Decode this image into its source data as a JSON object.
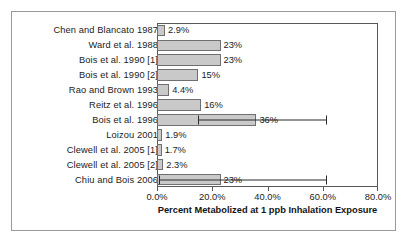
{
  "chart_data": {
    "type": "bar",
    "orientation": "horizontal",
    "title": "",
    "xlabel": "Percent Metabolized at 1 ppb Inhalation Exposure",
    "ylabel": "",
    "xlim": [
      0,
      80
    ],
    "xtick_labels": [
      "0.0%",
      "20.0%",
      "40.0%",
      "60.0%",
      "80.0%"
    ],
    "xticks": [
      0,
      20,
      40,
      60,
      80
    ],
    "grid": false,
    "legend": null,
    "bar_color": "#c9c9c9",
    "bar_edge_color": "#6f6f71",
    "categories": [
      "Chen and Blancato 1987",
      "Ward et al. 1988",
      "Bois et al. 1990 [1]",
      "Bois et al. 1990 [2]",
      "Rao and Brown 1993",
      "Reitz et al. 1996",
      "Bois et al. 1996",
      "Loizou 2001",
      "Clewell et al. 2005 [1]",
      "Clewell et al. 2005 [2]",
      "Chiu and Bois 2006"
    ],
    "values": [
      2.9,
      23,
      23,
      15,
      4.4,
      16,
      36,
      1.9,
      1.7,
      2.3,
      23
    ],
    "data_labels": [
      "2.9%",
      "23%",
      "23%",
      "15%",
      "4.4%",
      "16%",
      "36%",
      "1.9%",
      "1.7%",
      "2.3%",
      "23%"
    ],
    "error_bars": [
      null,
      null,
      null,
      null,
      null,
      null,
      {
        "low": 15,
        "high": 61
      },
      null,
      null,
      null,
      {
        "low": 0.8,
        "high": 61
      }
    ]
  }
}
